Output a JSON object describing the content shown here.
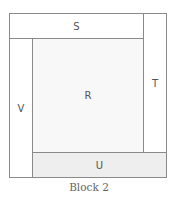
{
  "diagram": {
    "caption": "Block 2",
    "pieces": [
      {
        "id": "S",
        "label": "S",
        "color": "#ffffff"
      },
      {
        "id": "T",
        "label": "T",
        "color": "#ffffff"
      },
      {
        "id": "U",
        "label": "U",
        "color": "#eeeeee"
      },
      {
        "id": "V",
        "label": "V",
        "color": "#ffffff"
      },
      {
        "id": "R",
        "label": "R",
        "color": "#f8f8f8"
      }
    ]
  }
}
